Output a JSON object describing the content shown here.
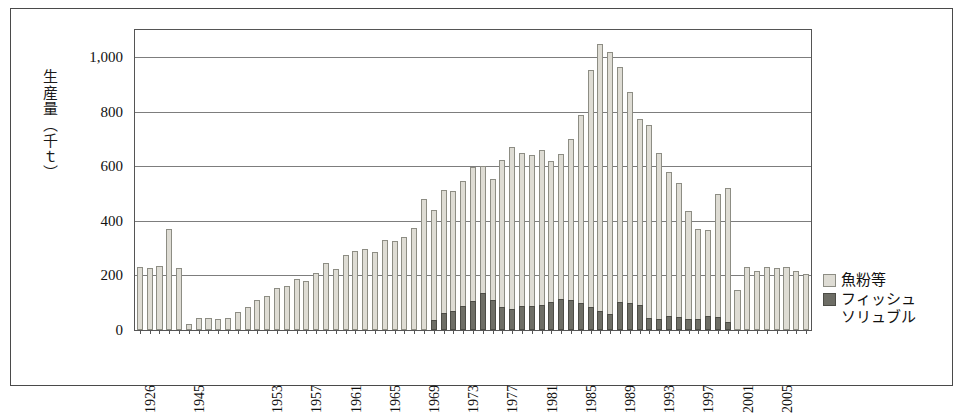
{
  "chart_data": {
    "type": "bar",
    "stacked": true,
    "title": "",
    "xlabel": "",
    "ylabel": "生産量（千ｔ）",
    "ylim": [
      0,
      1100
    ],
    "yticks": [
      0,
      200,
      400,
      600,
      800,
      1000
    ],
    "ytick_labels": [
      "0",
      "200",
      "400",
      "600",
      "800",
      "1,000"
    ],
    "grid": true,
    "legend_position": "right",
    "xtick_labels": [
      "1926",
      "1945",
      "1953",
      "1957",
      "1961",
      "1965",
      "1969",
      "1973",
      "1977",
      "1981",
      "1985",
      "1989",
      "1993",
      "1997",
      "2001",
      "2005"
    ],
    "categories": [
      "1926",
      "1927",
      "1928",
      "1929",
      "1930",
      "1945",
      "1946",
      "1947",
      "1948",
      "1949",
      "1950",
      "1951",
      "1952",
      "1953",
      "1954",
      "1955",
      "1956",
      "1957",
      "1958",
      "1959",
      "1960",
      "1961",
      "1962",
      "1963",
      "1964",
      "1965",
      "1966",
      "1967",
      "1968",
      "1969",
      "1970",
      "1971",
      "1972",
      "1973",
      "1974",
      "1975",
      "1976",
      "1977",
      "1978",
      "1979",
      "1980",
      "1981",
      "1982",
      "1983",
      "1984",
      "1985",
      "1986",
      "1987",
      "1988",
      "1989",
      "1990",
      "1991",
      "1992",
      "1993",
      "1994",
      "1995",
      "1996",
      "1997",
      "1998",
      "1999",
      "2000",
      "2001",
      "2002",
      "2003",
      "2004",
      "2005",
      "2006",
      "2007",
      "2008"
    ],
    "series": [
      {
        "name": "魚粉等",
        "color": "#dedcd4",
        "values": [
          232,
          227,
          233,
          370,
          228,
          22,
          43,
          44,
          42,
          43,
          67,
          83,
          110,
          123,
          155,
          160,
          187,
          180,
          210,
          245,
          225,
          275,
          290,
          296,
          285,
          330,
          325,
          340,
          375,
          480,
          440,
          512,
          508,
          545,
          598,
          600,
          555,
          625,
          670,
          648,
          640,
          660,
          620,
          645,
          700,
          790,
          955,
          1048,
          1018,
          965,
          872,
          775,
          750,
          650,
          578,
          540,
          435,
          372,
          365,
          497,
          520,
          145,
          232,
          215,
          230,
          228,
          232,
          215,
          205
        ]
      },
      {
        "name": "フィッシュソリュブル",
        "color": "#6e6e66",
        "values": [
          0,
          0,
          0,
          0,
          0,
          0,
          0,
          0,
          0,
          0,
          0,
          0,
          0,
          0,
          0,
          0,
          0,
          0,
          0,
          0,
          0,
          0,
          0,
          0,
          0,
          0,
          0,
          0,
          0,
          0,
          38,
          64,
          70,
          88,
          105,
          135,
          110,
          85,
          78,
          87,
          88,
          93,
          102,
          113,
          110,
          98,
          85,
          68,
          60,
          102,
          98,
          92,
          45,
          40,
          50,
          48,
          42,
          40,
          53,
          48,
          30,
          0,
          0,
          0,
          0,
          0,
          0,
          0,
          0
        ]
      }
    ]
  },
  "legend": {
    "items": [
      {
        "label": "魚粉等",
        "swatch": "light"
      },
      {
        "label": "フィッシュソリュブル",
        "swatch": "dark"
      }
    ],
    "item0_label": "魚粉等",
    "item1_line1": "フィッシュ",
    "item1_line2": "ソリュブル"
  },
  "axis": {
    "y_title": "生産量（千ｔ）"
  }
}
